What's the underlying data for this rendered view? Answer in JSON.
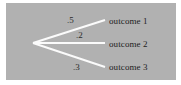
{
  "diagram": {
    "background_color": "#b1b1b1",
    "page_background_color": "#ffffff",
    "line_color": "#fbfbfb",
    "text_color": "#222222",
    "root": {
      "name": "root-node",
      "x": 33,
      "y": 43
    },
    "branches": [
      {
        "probability": ".5",
        "outcome": "outcome 1",
        "end_x": 105,
        "end_y": 20
      },
      {
        "probability": ".2",
        "outcome": "outcome 2",
        "end_x": 105,
        "end_y": 43
      },
      {
        "probability": ".3",
        "outcome": "outcome 3",
        "end_x": 105,
        "end_y": 67
      }
    ]
  }
}
